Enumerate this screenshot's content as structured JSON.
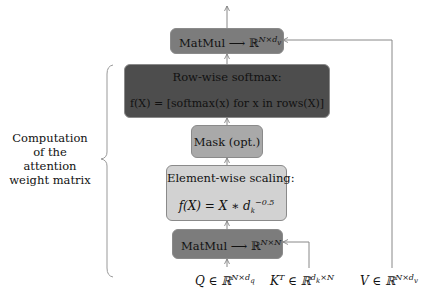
{
  "diagram": {
    "top_matmul": {
      "op": "MatMul",
      "arrow": "⟶",
      "space": "ℝ",
      "sup": "N×d",
      "sub": "v"
    },
    "softmax": {
      "title": "Row-wise softmax:",
      "formula": "f(X) = [softmax(x) for x in rows(X)]"
    },
    "mask": {
      "label": "Mask (opt.)"
    },
    "scaling": {
      "title": "Element-wise scaling:",
      "formula_lhs": "f(X) = X ∗ d",
      "formula_sub": "k",
      "formula_sup": "−0.5"
    },
    "bottom_matmul": {
      "op": "MatMul",
      "arrow": "⟶",
      "space": "ℝ",
      "sup": "N×N"
    },
    "inputs": {
      "q": {
        "base": "Q ∈ ℝ",
        "sup": "N×d",
        "sub": "q"
      },
      "k": {
        "base": "K",
        "t": "T",
        "mid": " ∈ ℝ",
        "sup": "d",
        "sub": "k",
        "sup2": "×N"
      },
      "v": {
        "base": "V ∈ ℝ",
        "sup": "N×d",
        "sub": "v"
      }
    },
    "brace_label": [
      "Computation",
      "of the",
      "attention",
      "weight matrix"
    ]
  }
}
